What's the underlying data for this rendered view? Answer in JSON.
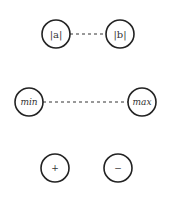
{
  "nodes": [
    {
      "id": "abs_a",
      "label": "|a|",
      "cx": 56,
      "cy": 34,
      "r": 14
    },
    {
      "id": "abs_b",
      "label": "|b|",
      "cx": 120,
      "cy": 34,
      "r": 14
    },
    {
      "id": "min",
      "label": "min",
      "cx": 29,
      "cy": 102,
      "r": 14
    },
    {
      "id": "max",
      "label": "max",
      "cx": 142,
      "cy": 102,
      "r": 14
    },
    {
      "id": "plus",
      "label": "+",
      "cx": 55,
      "cy": 168,
      "r": 14
    },
    {
      "id": "minus",
      "label": "−",
      "cx": 118,
      "cy": 168,
      "r": 14
    }
  ],
  "edges": [
    {
      "from": "abs_a",
      "to": "abs_b",
      "style": "dashed"
    },
    {
      "from": "min",
      "to": "max",
      "style": "dashed"
    }
  ]
}
